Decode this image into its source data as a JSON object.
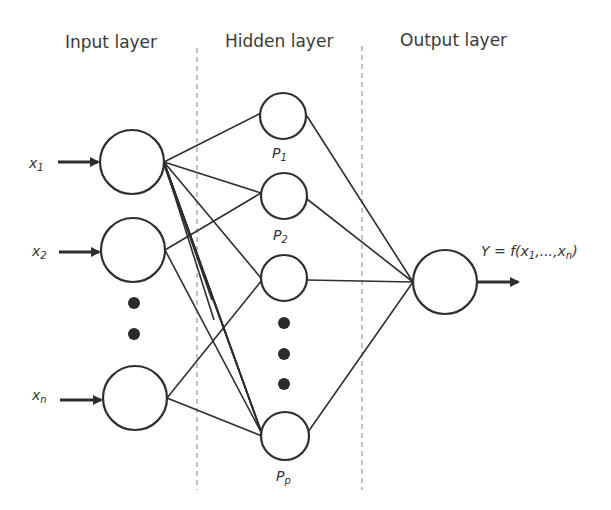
{
  "headers": {
    "input": "Input layer",
    "hidden": "Hidden layer",
    "output": "Output layer"
  },
  "inputs": [
    {
      "label": "x",
      "sub": "1"
    },
    {
      "label": "x",
      "sub": "2"
    },
    {
      "label": "x",
      "sub": "n"
    }
  ],
  "hidden": [
    {
      "label": "P",
      "sub": "1"
    },
    {
      "label": "P",
      "sub": "2"
    },
    {
      "label": "",
      "sub": ""
    },
    {
      "label": "P",
      "sub": "p"
    }
  ],
  "output": {
    "label": "Y = f(x",
    "sub1": "1",
    "mid": ",...,x",
    "sub2": "n",
    "end": ")"
  },
  "colors": {
    "stroke": "#2e2e2e",
    "divider": "#9a9a9a",
    "text": "#3a3a3a"
  }
}
